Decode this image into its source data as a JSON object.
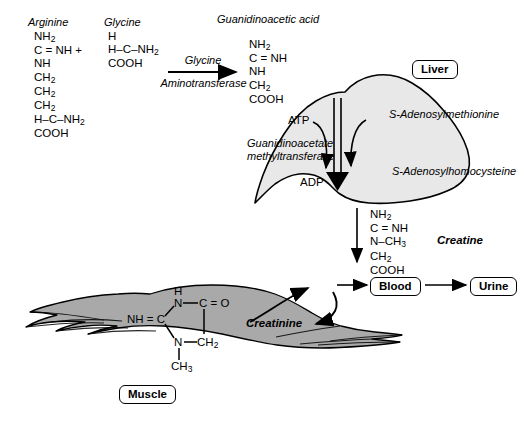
{
  "diagram": {
    "colors": {
      "liver_fill": "#e8e8e8",
      "muscle_fill": "#a9a9a9",
      "stroke": "#000000",
      "background": "#ffffff"
    }
  },
  "reactants": {
    "arginine": {
      "name": "Arginine",
      "lines": [
        "NH2",
        "C = NH +",
        "NH",
        "CH2",
        "CH2",
        "CH2",
        "H–C–NH2",
        "COOH"
      ]
    },
    "glycine": {
      "name": "Glycine",
      "lines": [
        "H",
        "H–C–NH2",
        "COOH"
      ]
    },
    "guanidinoacetic_acid": {
      "name": "Guanidinoacetic acid",
      "lines": [
        "NH2",
        "C = NH",
        "NH",
        "CH2",
        "COOH"
      ]
    },
    "creatine": {
      "name": "Creatine",
      "lines": [
        "NH2",
        "C = NH",
        "N–CH3",
        "CH2",
        "COOH"
      ]
    }
  },
  "enzymes": {
    "glycine_aminotransferase": {
      "line1": "Glycine",
      "line2": "Aminotransferase"
    },
    "guanidinoacetate_methyltransferase": {
      "line1": "Guanidinoacetate",
      "line2": "methyltransferase"
    }
  },
  "cofactors": {
    "atp": "ATP",
    "adp": "ADP",
    "sam": "S-Adenosylmethionine",
    "sah": "S-Adenosylhomocysteine"
  },
  "organs": {
    "liver": "Liver",
    "muscle": "Muscle",
    "blood": "Blood",
    "urine": "Urine"
  },
  "products": {
    "creatinine": "Creatinine"
  },
  "creatinine_ring": {
    "label": "Creatinine",
    "atoms": {
      "h_top": "H",
      "n_top": "N",
      "c_carbonyl": "C = O",
      "nh_left": "NH = C",
      "n_bottom": "N",
      "ch2": "CH2",
      "ch3": "CH3"
    }
  }
}
